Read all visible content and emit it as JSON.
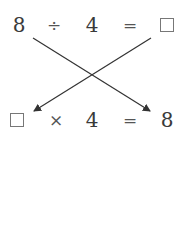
{
  "top_equation": {
    "operand1": "8",
    "operator": "÷",
    "operand2": "4",
    "equals": "=",
    "result": "blank-box"
  },
  "bottom_equation": {
    "operand1": "blank-box",
    "operator": "×",
    "operand2": "4",
    "equals": "=",
    "result": "8"
  },
  "arrows": [
    {
      "from": "top.operand1",
      "to": "bottom.result"
    },
    {
      "from": "top.result",
      "to": "bottom.operand1"
    }
  ],
  "colors": {
    "line": "#333333",
    "box_border": "#777777"
  }
}
